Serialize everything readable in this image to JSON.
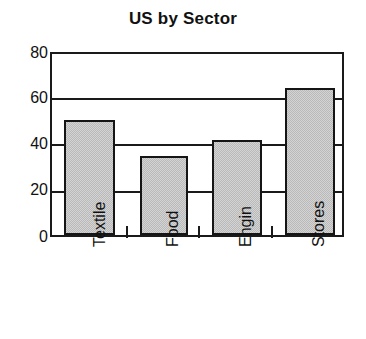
{
  "chart_data": {
    "type": "bar",
    "title": "US by Sector",
    "xlabel": "",
    "ylabel": "",
    "categories": [
      "Textile",
      "Food",
      "Engin",
      "Stores"
    ],
    "values": [
      51,
      35,
      42,
      65
    ],
    "ylim": [
      0,
      80
    ],
    "yticks": [
      0,
      20,
      40,
      60,
      80
    ],
    "ytick_labels": [
      "0",
      "20",
      "40",
      "60",
      "80"
    ],
    "grid": true,
    "legend": null,
    "series": [
      {
        "name": "US by Sector",
        "values": [
          51,
          35,
          42,
          65
        ]
      }
    ],
    "style": {
      "bar_fill": "#d4d4d4",
      "bar_edge": "#151515",
      "axis_color": "#1a1a1a",
      "background": "#ffffff"
    }
  }
}
